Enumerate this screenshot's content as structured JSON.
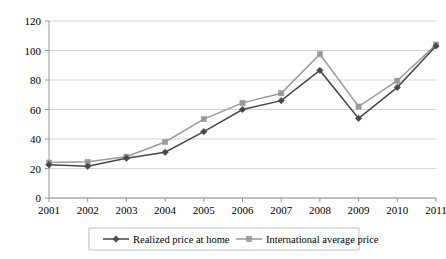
{
  "chart_data": {
    "type": "line",
    "title": "",
    "subtitle": "",
    "xlabel": "",
    "ylabel": "",
    "grid": true,
    "grid_axis": "y",
    "legend_position": "bottom",
    "ylim": [
      0,
      120
    ],
    "ytick_step": 20,
    "yticks": [
      "0",
      "20",
      "40",
      "60",
      "80",
      "100",
      "120"
    ],
    "categories": [
      "2001",
      "2002",
      "2003",
      "2004",
      "2005",
      "2006",
      "2007",
      "2008",
      "2009",
      "2010",
      "2011"
    ],
    "series": [
      {
        "name": "Realized price at home",
        "color": "#484848",
        "marker": "diamond",
        "values": [
          22.5,
          21.5,
          27,
          31,
          45,
          60,
          66,
          86.5,
          54,
          75,
          103
        ]
      },
      {
        "name": "International average price",
        "color": "#9a9a9a",
        "marker": "square",
        "values": [
          24,
          24.5,
          28,
          38,
          53.5,
          64.5,
          71,
          97.5,
          62,
          79.5,
          104
        ]
      }
    ]
  },
  "legend": {
    "items": [
      {
        "label": "Realized price at home"
      },
      {
        "label": "International average price"
      }
    ]
  },
  "colors": {
    "series_dark": "#484848",
    "series_gray": "#9a9a9a",
    "grid": "#c8c8c8",
    "axis": "#8a8a8a",
    "text": "#000000",
    "background": "#ffffff"
  }
}
